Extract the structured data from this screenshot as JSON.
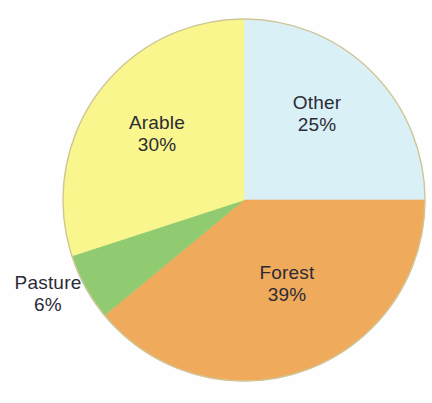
{
  "chart_data": {
    "type": "pie",
    "title": "",
    "subtitle": "",
    "xlabel": "",
    "ylabel": "",
    "legend_position": "none",
    "grid": false,
    "labels_inside": true,
    "unit": "%",
    "total": 100,
    "categories": [
      "Other",
      "Forest",
      "Pasture",
      "Arable"
    ],
    "values": [
      25,
      39,
      6,
      30
    ],
    "colors": [
      "#d9f0f7",
      "#f0aa5c",
      "#90cb72",
      "#f8f68c"
    ],
    "start_angle_deg": 0,
    "direction": "clockwise",
    "slices": [
      {
        "id": "other",
        "label": "Other",
        "value": 25,
        "value_text": "25%",
        "color": "#d9f0f7",
        "start_deg": 0,
        "end_deg": 90,
        "label_placement": "inside"
      },
      {
        "id": "forest",
        "label": "Forest",
        "value": 39,
        "value_text": "39%",
        "color": "#f0aa5c",
        "start_deg": 90,
        "end_deg": 230.4,
        "label_placement": "inside"
      },
      {
        "id": "pasture",
        "label": "Pasture",
        "value": 6,
        "value_text": "6%",
        "color": "#90cb72",
        "start_deg": 230.4,
        "end_deg": 252,
        "label_placement": "outside-left"
      },
      {
        "id": "arable",
        "label": "Arable",
        "value": 30,
        "value_text": "30%",
        "color": "#f8f68c",
        "start_deg": 252,
        "end_deg": 360,
        "label_placement": "inside"
      }
    ],
    "geometry": {
      "center_x": 244,
      "center_y": 200,
      "radius": 181,
      "stroke_color": "#cfc79a",
      "stroke_width": 1
    },
    "text_color": "#2b2b36",
    "background": "#fefefe"
  }
}
